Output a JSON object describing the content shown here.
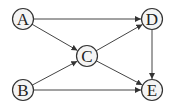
{
  "diagram": {
    "type": "directed-graph",
    "nodes": [
      {
        "id": "A",
        "label": "A",
        "x": 23,
        "y": 19
      },
      {
        "id": "B",
        "label": "B",
        "x": 23,
        "y": 90
      },
      {
        "id": "C",
        "label": "C",
        "x": 87,
        "y": 56
      },
      {
        "id": "D",
        "label": "D",
        "x": 152,
        "y": 19
      },
      {
        "id": "E",
        "label": "E",
        "x": 152,
        "y": 90
      }
    ],
    "edges": [
      {
        "from": "A",
        "to": "D"
      },
      {
        "from": "A",
        "to": "C"
      },
      {
        "from": "B",
        "to": "C"
      },
      {
        "from": "B",
        "to": "E"
      },
      {
        "from": "C",
        "to": "D"
      },
      {
        "from": "C",
        "to": "E"
      },
      {
        "from": "D",
        "to": "E"
      }
    ],
    "node_radius": 10.5,
    "colors": {
      "node_fill": "#f4f4f4",
      "stroke": "#333333",
      "edge": "#444444"
    }
  }
}
